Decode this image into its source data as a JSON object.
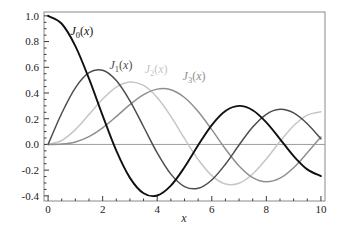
{
  "figure": {
    "background": "#ffffff",
    "width": 343,
    "height": 241
  },
  "chart_data": {
    "type": "line",
    "title": "",
    "xlabel": "x",
    "ylabel": "",
    "xlim": [
      0,
      10
    ],
    "ylim": [
      -0.4,
      1.0
    ],
    "grid": false,
    "legend": "inline-curve-labels",
    "frame": true,
    "frame_color": "#8a8a8a",
    "axis_line_color": "#9c9c9c",
    "tick_color": "#383838",
    "tick_label_color": "#1a1a1a",
    "x_ticks": {
      "major": [
        0,
        2,
        4,
        6,
        8,
        10
      ],
      "labels": [
        "0",
        "2",
        "4",
        "6",
        "8",
        "10"
      ],
      "minor_step": 0.5
    },
    "y_ticks": {
      "major": [
        -0.4,
        -0.2,
        0,
        0.2,
        0.4,
        0.6,
        0.8,
        1.0
      ],
      "labels": [
        "-0.4",
        "-0.2",
        "0.0",
        "0.2",
        "0.4",
        "0.6",
        "0.8",
        "1.0"
      ],
      "minor_step": 0.05
    },
    "x": [
      0,
      0.5,
      1,
      1.5,
      2,
      2.5,
      3,
      3.5,
      4,
      4.5,
      5,
      5.5,
      6,
      6.5,
      7,
      7.5,
      8,
      8.5,
      9,
      9.5,
      10
    ],
    "series": [
      {
        "name": "J0(x)",
        "label": {
          "base": "J",
          "sub": "0",
          "arg": "x"
        },
        "color": "#111111",
        "line_width": 1.9,
        "label_pos": [
          1.24,
          0.88
        ],
        "values": [
          1.0,
          0.9385,
          0.7652,
          0.5118,
          0.2239,
          -0.0484,
          -0.2601,
          -0.3801,
          -0.3971,
          -0.3205,
          -0.1776,
          -0.0068,
          0.1506,
          0.2601,
          0.3001,
          0.2663,
          0.1717,
          0.0419,
          -0.0903,
          -0.1939,
          -0.2459
        ]
      },
      {
        "name": "J1(x)",
        "label": {
          "base": "J",
          "sub": "1",
          "arg": "x"
        },
        "color": "#4d4d4d",
        "line_width": 1.5,
        "label_pos": [
          2.67,
          0.62
        ],
        "values": [
          0.0,
          0.2423,
          0.4401,
          0.5579,
          0.5767,
          0.4971,
          0.3391,
          0.1374,
          -0.066,
          -0.2311,
          -0.3276,
          -0.3414,
          -0.2767,
          -0.1538,
          -0.0047,
          0.1352,
          0.2346,
          0.2731,
          0.2453,
          0.1613,
          0.0435
        ]
      },
      {
        "name": "J2(x)",
        "label": {
          "base": "J",
          "sub": "2",
          "arg": "x"
        },
        "color": "#c6c6c6",
        "line_width": 1.5,
        "label_pos": [
          3.96,
          0.59
        ],
        "values": [
          0.0,
          0.0306,
          0.1149,
          0.2321,
          0.3528,
          0.4461,
          0.4861,
          0.4586,
          0.3641,
          0.2178,
          0.0466,
          -0.1173,
          -0.2429,
          -0.3074,
          -0.3014,
          -0.2303,
          -0.113,
          0.0223,
          0.1448,
          0.2279,
          0.2546
        ]
      },
      {
        "name": "J3(x)",
        "label": {
          "base": "J",
          "sub": "3",
          "arg": "x"
        },
        "color": "#8f8f8f",
        "line_width": 1.5,
        "label_pos": [
          5.35,
          0.53
        ],
        "values": [
          0.0,
          0.0026,
          0.0196,
          0.061,
          0.1289,
          0.2166,
          0.3091,
          0.3868,
          0.4302,
          0.4247,
          0.3648,
          0.2561,
          0.1148,
          -0.0353,
          -0.1676,
          -0.2583,
          -0.2911,
          -0.2626,
          -0.1809,
          -0.0653,
          0.0584
        ]
      }
    ]
  }
}
